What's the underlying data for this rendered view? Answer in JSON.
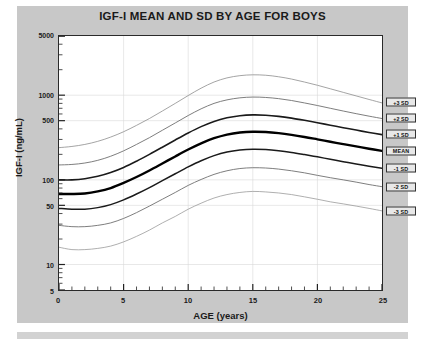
{
  "chart_data": {
    "type": "line",
    "title": "IGF-I MEAN AND SD BY AGE FOR BOYS",
    "xlabel": "AGE (years)",
    "ylabel": "IGF-I (ng/mL)",
    "xlim": [
      0,
      25
    ],
    "ylim": [
      5,
      5000
    ],
    "yscale": "log",
    "grid": true,
    "legend_position": "right-outside",
    "xticks": [
      0,
      5,
      10,
      15,
      20,
      25
    ],
    "xtick_labels": [
      "0",
      "5",
      "10",
      "15",
      "20",
      "25"
    ],
    "yticks": [
      5,
      10,
      50,
      100,
      500,
      1000,
      5000
    ],
    "ytick_labels": [
      "5",
      "10",
      "50",
      "100",
      "500",
      "1000",
      "5000"
    ],
    "x": [
      0,
      1,
      2,
      3,
      4,
      5,
      6,
      7,
      8,
      9,
      10,
      11,
      12,
      13,
      14,
      15,
      16,
      17,
      18,
      19,
      20,
      21,
      22,
      23,
      24,
      25
    ],
    "series": [
      {
        "name": "+3 SD",
        "label": "+3 SD",
        "color": "#8c8c8c",
        "width": 0.8,
        "values": [
          240,
          248,
          262,
          285,
          320,
          370,
          440,
          530,
          650,
          800,
          990,
          1210,
          1430,
          1600,
          1700,
          1740,
          1720,
          1650,
          1550,
          1430,
          1310,
          1190,
          1080,
          980,
          890,
          810
        ]
      },
      {
        "name": "+2 SD",
        "label": "+2 SD",
        "color": "#6e6e6e",
        "width": 0.9,
        "values": [
          150,
          152,
          158,
          170,
          190,
          220,
          262,
          315,
          385,
          470,
          575,
          690,
          800,
          880,
          930,
          950,
          940,
          910,
          865,
          810,
          755,
          700,
          650,
          605,
          565,
          530
        ]
      },
      {
        "name": "+1 SD",
        "label": "+1 SD",
        "color": "#1a1a1a",
        "width": 1.6,
        "values": [
          100,
          100,
          103,
          110,
          122,
          140,
          166,
          200,
          243,
          296,
          358,
          425,
          490,
          540,
          572,
          585,
          580,
          562,
          536,
          505,
          473,
          442,
          413,
          387,
          363,
          342
        ]
      },
      {
        "name": "MEAN",
        "label": "MEAN",
        "color": "#000000",
        "width": 2.4,
        "values": [
          68,
          68,
          69,
          73,
          80,
          92,
          108,
          129,
          156,
          189,
          228,
          270,
          310,
          342,
          362,
          370,
          367,
          356,
          340,
          321,
          301,
          282,
          264,
          248,
          233,
          220
        ]
      },
      {
        "name": "-1 SD",
        "label": "-1 SD",
        "color": "#1a1a1a",
        "width": 1.5,
        "values": [
          46,
          45,
          45,
          47,
          51,
          58,
          68,
          81,
          98,
          118,
          142,
          168,
          193,
          213,
          225,
          230,
          228,
          221,
          211,
          199,
          187,
          175,
          164,
          154,
          145,
          137
        ]
      },
      {
        "name": "-2 SD",
        "label": "-2 SD",
        "color": "#6e6e6e",
        "width": 0.9,
        "values": [
          29,
          28,
          28,
          29,
          31,
          35,
          41,
          49,
          59,
          71,
          86,
          101,
          116,
          128,
          136,
          139,
          138,
          134,
          128,
          121,
          113,
          106,
          100,
          94,
          88,
          83
        ]
      },
      {
        "name": "-3 SD",
        "label": "-3 SD",
        "color": "#9a9a9a",
        "width": 0.8,
        "values": [
          16,
          15,
          15,
          15.5,
          16.5,
          18.5,
          21.5,
          25.5,
          31,
          37,
          45,
          53,
          61,
          67,
          71,
          73,
          72,
          70,
          67,
          63,
          59,
          55,
          52,
          49,
          46,
          43
        ]
      }
    ]
  }
}
